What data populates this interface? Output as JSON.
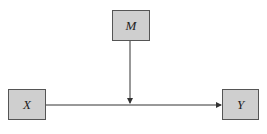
{
  "diagram": {
    "type": "moderation-model",
    "nodes": [
      {
        "id": "M",
        "label": "M"
      },
      {
        "id": "X",
        "label": "X"
      },
      {
        "id": "Y",
        "label": "Y"
      }
    ],
    "edges": [
      {
        "from": "X",
        "to": "Y"
      },
      {
        "from": "M",
        "to": "X->Y path"
      }
    ],
    "colors": {
      "node_fill": "#cfcfcf",
      "node_border": "#555555",
      "line": "#333333"
    }
  }
}
